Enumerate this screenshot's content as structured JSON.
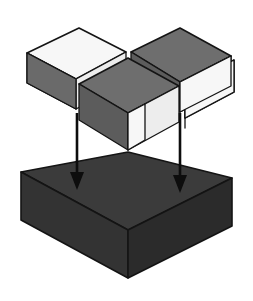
{
  "figure": {
    "background_color": "#ffffff",
    "outline_color": "#141414",
    "projection": "isometric"
  },
  "colors": {
    "light_tile": "#f7f7f7",
    "mid_gray_tile": "#6e6e6e",
    "side_light": "#ededed",
    "side_mid": "#6a6a6a",
    "side_dark": "#5c5c5c",
    "slab_top": "#3b3b3b",
    "slab_front_left": "#333333",
    "slab_front_right": "#2b2b2b",
    "arrow_color": "#0d0d0d",
    "outline": "#141414"
  },
  "upper_layer": {
    "name": "checkerboard-layer",
    "rows": 2,
    "cols": 2,
    "tile_count": 4,
    "pattern": "alternating",
    "tiles": [
      {
        "id": "tile-back-left",
        "position": "back-left",
        "shade": "light",
        "fill": "#f7f7f7"
      },
      {
        "id": "tile-back-right",
        "position": "back-right",
        "shade": "dark",
        "fill": "#6e6e6e"
      },
      {
        "id": "tile-front-left",
        "position": "front-left",
        "shade": "dark",
        "fill": "#6e6e6e"
      },
      {
        "id": "tile-front-right",
        "position": "front-right",
        "shade": "light",
        "fill": "#f7f7f7"
      }
    ],
    "separated": true,
    "gap_visible": true
  },
  "lower_layer": {
    "name": "solid-slab",
    "shade": "dark",
    "top_fill": "#3b3b3b",
    "left_fill": "#333333",
    "right_fill": "#2b2b2b"
  },
  "arrows": [
    {
      "id": "arrow-left",
      "direction": "down",
      "x": 77,
      "y_start": 113,
      "y_end": 186
    },
    {
      "id": "arrow-right",
      "direction": "down",
      "x": 180,
      "y_start": 113,
      "y_end": 189
    }
  ]
}
